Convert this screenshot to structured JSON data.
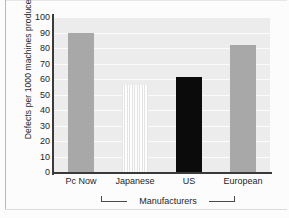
{
  "chart_data": {
    "type": "bar",
    "title": "",
    "subtitle": "",
    "xlabel": "Manufacturers",
    "ylabel": "Defects per 1000 machines produced",
    "categories": [
      "Pc Now",
      "Japanese",
      "US",
      "European"
    ],
    "values": [
      90,
      56,
      61,
      82
    ],
    "series": [
      {
        "name": "Defects per 1000 machines produced",
        "values": [
          90,
          56,
          61,
          82
        ]
      }
    ],
    "bar_styles": [
      "solid-gray",
      "light-hatched",
      "solid-black",
      "solid-gray"
    ],
    "ylim": [
      0,
      100
    ],
    "yticks": [
      "100",
      "90",
      "80",
      "70",
      "60",
      "50",
      "40",
      "30",
      "20",
      "10",
      "0"
    ],
    "ytick_values": [
      100,
      90,
      80,
      70,
      60,
      50,
      40,
      30,
      20,
      10,
      0
    ],
    "grid": true,
    "grid_axis": "y",
    "legend": false,
    "legend_position": "none",
    "group_bracket": {
      "label": "Manufacturers",
      "spans": [
        "Japanese",
        "European"
      ]
    },
    "colors": {
      "plot_background": "#ececec",
      "gridline": "#fbfbfb",
      "bar_gray": "#a8a8a8",
      "bar_black": "#0b0b0b",
      "bar_hatch": "#e4e4e4",
      "axis": "#3a3a3a",
      "text": "#1f1f1f",
      "figure_background": "#fcfcfc"
    }
  }
}
